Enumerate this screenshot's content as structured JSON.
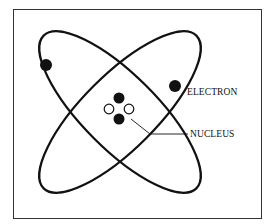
{
  "diagram": {
    "type": "atom-model",
    "labels": {
      "electron": "ELECTRON",
      "nucleus": "NUCLEUS"
    },
    "colors": {
      "stroke": "#111111",
      "frame": "#333333",
      "background": "#ffffff"
    },
    "orbits": [
      {
        "name": "orbit-1",
        "cx": 120,
        "cy": 112,
        "rx": 105,
        "ry": 38,
        "rotate": 45
      },
      {
        "name": "orbit-2",
        "cx": 120,
        "cy": 112,
        "rx": 105,
        "ry": 38,
        "rotate": -45
      }
    ],
    "electrons": [
      {
        "x": 45,
        "y": 65
      },
      {
        "x": 175,
        "y": 86
      }
    ],
    "nucleus_particles": [
      {
        "x": 119,
        "y": 98,
        "filled": true
      },
      {
        "x": 109,
        "y": 109,
        "filled": false
      },
      {
        "x": 129,
        "y": 109,
        "filled": false
      },
      {
        "x": 119,
        "y": 119,
        "filled": true
      }
    ]
  }
}
